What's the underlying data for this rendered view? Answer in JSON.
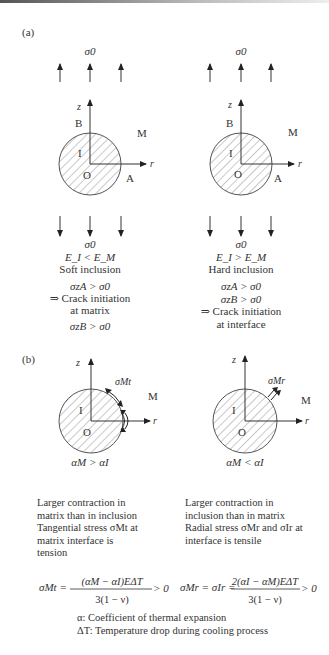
{
  "figure": {
    "panel_a": {
      "label": "(a)",
      "left": {
        "stress_top": "σ0",
        "stress_bottom": "σ0",
        "axis_z": "z",
        "axis_r": "r",
        "point_B": "B",
        "point_I": "I",
        "point_O": "O",
        "point_A": "A",
        "matrix_M": "M",
        "condition": "E_I < E_M",
        "type": "Soft inclusion",
        "stress_cond_1": "σzA > σ0",
        "result_line1": "⇒ Crack initiation",
        "result_line2": "at matrix",
        "stress_cond_2": "σzB > σ0"
      },
      "right": {
        "stress_top": "σ0",
        "stress_bottom": "σ0",
        "axis_z": "z",
        "axis_r": "r",
        "point_B": "B",
        "point_I": "I",
        "point_O": "O",
        "point_A": "A",
        "matrix_M": "M",
        "condition": "E_I > E_M",
        "type": "Hard inclusion",
        "stress_cond_1": "σzA > σ0",
        "stress_cond_2": "σzB > σ0",
        "result_line1": "⇒ Crack initiation",
        "result_line2": "at interface"
      }
    },
    "panel_b": {
      "label": "(b)",
      "left": {
        "axis_z": "z",
        "axis_r": "r",
        "point_I": "I",
        "point_O": "O",
        "matrix_M": "M",
        "stress_label": "σMt",
        "condition": "αM > αI",
        "desc": [
          "Larger contraction in",
          "matrix than in inclusion",
          "Tangential stress σMt at",
          "matrix interface is",
          "tension"
        ],
        "formula_lhs": "σMt =",
        "formula_num": "(αM − αI)EΔT",
        "formula_den": "3(1 − ν)",
        "formula_rhs": "> 0"
      },
      "right": {
        "axis_z": "z",
        "axis_r": "r",
        "point_I": "I",
        "point_O": "O",
        "matrix_M": "M",
        "stress_label": "σMr",
        "condition": "αM < αI",
        "desc": [
          "Larger contraction in",
          "inclusion than in matrix",
          "Radial stress σMr and σIr at",
          "interface is tensile"
        ],
        "formula_lhs": "σMr = σIr =",
        "formula_num": "2(αI − αM)EΔT",
        "formula_den": "3(1 − ν)",
        "formula_rhs": "> 0"
      }
    },
    "legend": {
      "alpha": "α: Coefficient of thermal expansion",
      "deltaT": "ΔT: Temperature drop during cooling process"
    }
  }
}
